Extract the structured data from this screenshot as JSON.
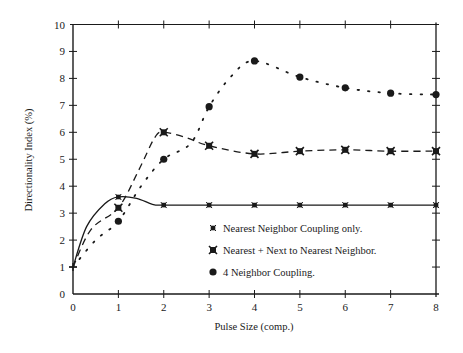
{
  "chart_data": {
    "type": "line",
    "title": "",
    "xlabel": "Pulse Size (comp.)",
    "ylabel": "Directionality Index (%)",
    "xlim": [
      0,
      8
    ],
    "ylim": [
      0,
      10
    ],
    "x_ticks": [
      "0",
      "1",
      "2",
      "3",
      "4",
      "5",
      "6",
      "7",
      "8"
    ],
    "y_ticks": [
      "0",
      "1",
      "2",
      "3",
      "4",
      "5",
      "6",
      "7",
      "8",
      "9",
      "10"
    ],
    "grid": false,
    "legend_position": "lower right (inside plot)",
    "x": [
      0,
      1,
      2,
      3,
      4,
      5,
      6,
      7,
      8
    ],
    "series": [
      {
        "name": "Nearest Neighbor Coupling only.",
        "marker": "small-x",
        "line_style": "solid",
        "values": [
          1.0,
          3.6,
          3.3,
          3.3,
          3.3,
          3.3,
          3.3,
          3.3,
          3.3
        ]
      },
      {
        "name": "Nearest + Next to Nearest Neighbor.",
        "marker": "bold-x",
        "line_style": "dashed",
        "values": [
          1.0,
          3.2,
          6.0,
          5.5,
          5.2,
          5.3,
          5.35,
          5.3,
          5.3
        ]
      },
      {
        "name": "4 Neighbor Coupling.",
        "marker": "filled-circle",
        "line_style": "dotted",
        "values": [
          1.0,
          2.7,
          5.0,
          6.95,
          8.65,
          8.05,
          7.65,
          7.45,
          7.4
        ]
      }
    ]
  },
  "labels": {
    "xlabel": "Pulse Size (comp.)",
    "ylabel": "Directionality Index (%)",
    "legend": [
      "Nearest Neighbor Coupling only.",
      "Nearest + Next to Nearest Neighbor.",
      "4 Neighbor Coupling."
    ]
  }
}
